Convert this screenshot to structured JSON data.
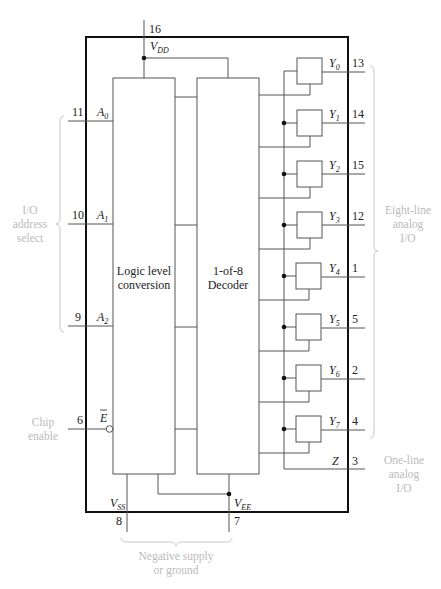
{
  "blocks": {
    "logic": {
      "line1": "Logic level",
      "line2": "conversion"
    },
    "decoder": {
      "line1": "1-of-8",
      "line2": "Decoder"
    }
  },
  "power": {
    "vdd": {
      "label": "V",
      "sub": "DD",
      "pin": "16"
    },
    "vss": {
      "label": "V",
      "sub": "SS",
      "pin": "8"
    },
    "vee": {
      "label": "V",
      "sub": "EE",
      "pin": "7"
    }
  },
  "inputs": [
    {
      "label": "A",
      "sub": "0",
      "pin": "11"
    },
    {
      "label": "A",
      "sub": "1",
      "pin": "10"
    },
    {
      "label": "A",
      "sub": "2",
      "pin": "9"
    },
    {
      "label": "E",
      "sub": "",
      "pin": "6"
    }
  ],
  "outputs": [
    {
      "label": "Y",
      "sub": "0",
      "pin": "13"
    },
    {
      "label": "Y",
      "sub": "1",
      "pin": "14"
    },
    {
      "label": "Y",
      "sub": "2",
      "pin": "15"
    },
    {
      "label": "Y",
      "sub": "3",
      "pin": "12"
    },
    {
      "label": "Y",
      "sub": "4",
      "pin": "1"
    },
    {
      "label": "Y",
      "sub": "5",
      "pin": "5"
    },
    {
      "label": "Y",
      "sub": "6",
      "pin": "2"
    },
    {
      "label": "Y",
      "sub": "7",
      "pin": "4"
    }
  ],
  "common": {
    "label": "Z",
    "pin": "3"
  },
  "annotations": {
    "address": [
      "I/O",
      "address",
      "select"
    ],
    "chip_enable": [
      "Chip",
      "enable"
    ],
    "eight_line": [
      "Eight-line",
      "analog",
      "I/O"
    ],
    "one_line": [
      "One-line",
      "analog",
      "I/O"
    ],
    "negative": [
      "Negative supply",
      "or ground"
    ]
  }
}
